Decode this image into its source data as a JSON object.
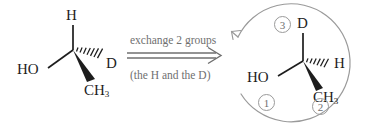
{
  "figure": {
    "type": "stereochemistry-reaction-diagram",
    "ink_color": "#1d1d1d",
    "annotation_color": "#6f6f6f"
  },
  "reactant": {
    "name": "left-stereostructure",
    "top_label": "H",
    "left_label": "HO",
    "right_label": "D",
    "bottom_label": "CH",
    "bottom_sub": "3",
    "bonds": [
      {
        "to": "H",
        "style": "plain"
      },
      {
        "to": "HO",
        "style": "plain"
      },
      {
        "to": "D",
        "style": "hashed-wedge"
      },
      {
        "to": "CH3",
        "style": "bold-wedge"
      }
    ]
  },
  "reaction": {
    "name": "exchange-arrow",
    "caption_top": "exchange 2 groups",
    "caption_bottom": "(the H and the D)",
    "arrow_style": "double-line-open-head"
  },
  "product": {
    "name": "right-stereostructure",
    "top_label": "D",
    "left_label": "HO",
    "right_label": "H",
    "bottom_label": "CH",
    "bottom_sub": "3",
    "bonds": [
      {
        "to": "D",
        "style": "plain"
      },
      {
        "to": "HO",
        "style": "plain"
      },
      {
        "to": "H",
        "style": "hashed-wedge"
      },
      {
        "to": "CH3",
        "style": "bold-wedge"
      }
    ],
    "priority_labels": [
      {
        "number": "1",
        "near": "HO"
      },
      {
        "number": "2",
        "near": "CH3"
      },
      {
        "number": "3",
        "near": "D"
      }
    ],
    "rotation_arrow": {
      "direction": "counterclockwise",
      "style": "curved-open-arc-with-arrowhead"
    }
  }
}
